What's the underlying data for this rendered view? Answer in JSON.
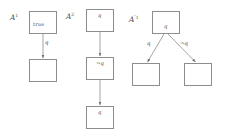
{
  "figure": {
    "background_color": "#ffffff",
    "line_color": "#8d8d8d",
    "text_color": "#4a4a4a"
  },
  "diagrams": [
    {
      "id": "A1",
      "label_base": "A",
      "label_prime": "",
      "label_sup": "1",
      "label_text": "A1",
      "nodes": [
        {
          "id": "a1-root",
          "content": "true",
          "style": "word",
          "x": 29,
          "y": 11,
          "w": 28,
          "h": 23
        },
        {
          "id": "a1-child",
          "content": "",
          "style": "empty",
          "x": 29,
          "y": 59,
          "w": 28,
          "h": 23
        }
      ],
      "edges": [
        {
          "id": "a1-edge-1",
          "from": "a1-root",
          "to": "a1-child",
          "label": "q",
          "x1": 43,
          "y1": 34,
          "x2": 43,
          "y2": 59,
          "label_x": 45,
          "label_y": 42
        }
      ]
    },
    {
      "id": "A2",
      "label_base": "A",
      "label_prime": "",
      "label_sup": "2",
      "label_text": "A2",
      "nodes": [
        {
          "id": "a2-root",
          "content": "q",
          "style": "italic",
          "x": 86,
          "y": 9,
          "w": 28,
          "h": 23
        },
        {
          "id": "a2-mid",
          "content": "¬q",
          "style": "italic",
          "x": 86,
          "y": 57,
          "w": 28,
          "h": 23
        },
        {
          "id": "a2-leaf",
          "content": "q",
          "style": "italic",
          "x": 86,
          "y": 106,
          "w": 28,
          "h": 23
        }
      ],
      "edges": [
        {
          "id": "a2-edge-1",
          "from": "a2-root",
          "to": "a2-mid",
          "label": "",
          "x1": 100,
          "y1": 32,
          "x2": 100,
          "y2": 57,
          "label_x": 0,
          "label_y": 0
        },
        {
          "id": "a2-edge-2",
          "from": "a2-mid",
          "to": "a2-leaf",
          "label": "",
          "x1": 100,
          "y1": 80,
          "x2": 100,
          "y2": 106,
          "label_x": 0,
          "label_y": 0
        }
      ]
    },
    {
      "id": "Ap1",
      "label_base": "A",
      "label_prime": "′",
      "label_sup": "1",
      "label_text": "A'1",
      "nodes": [
        {
          "id": "ap-root",
          "content": "q",
          "style": "italic",
          "x": 152,
          "y": 11,
          "w": 28,
          "h": 23
        },
        {
          "id": "ap-left",
          "content": "",
          "style": "empty",
          "x": 132,
          "y": 63,
          "w": 28,
          "h": 23
        },
        {
          "id": "ap-right",
          "content": "",
          "style": "empty",
          "x": 184,
          "y": 63,
          "w": 28,
          "h": 23
        }
      ],
      "edges": [
        {
          "id": "ap-edge-left",
          "from": "ap-root",
          "to": "ap-left",
          "label": "q",
          "x1": 164,
          "y1": 34,
          "x2": 147,
          "y2": 63,
          "label_x": 140,
          "label_y": 43
        },
        {
          "id": "ap-edge-right",
          "from": "ap-root",
          "to": "ap-right",
          "label": "¬q",
          "x1": 168,
          "y1": 34,
          "x2": 196,
          "y2": 63,
          "label_x": 181,
          "label_y": 43
        }
      ]
    }
  ],
  "diagram_labels": [
    {
      "id": "label-A1",
      "base": "A",
      "prime": "",
      "sup": "1",
      "x": 10,
      "y": 18
    },
    {
      "id": "label-A2",
      "base": "A",
      "prime": "",
      "sup": "2",
      "x": 66,
      "y": 17
    },
    {
      "id": "label-Ap1",
      "base": "A",
      "prime": "′",
      "sup": "1",
      "x": 129,
      "y": 19
    }
  ]
}
